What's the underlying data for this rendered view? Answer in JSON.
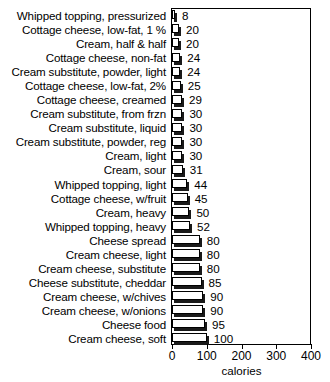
{
  "chart_data": {
    "type": "bar",
    "orientation": "horizontal",
    "title": "",
    "xlabel": "calories",
    "ylabel": "",
    "xlim": [
      0,
      400
    ],
    "xticks": [
      0,
      100,
      200,
      300,
      400
    ],
    "xtick_labels": [
      "0",
      "100",
      "200",
      "300",
      "400"
    ],
    "grid": false,
    "legend": false,
    "categories": [
      "Whipped topping, pressurized",
      "Cottage cheese, low-fat, 1 %",
      "Cream, half & half",
      "Cottage cheese, non-fat",
      "Cream substitute, powder, light",
      "Cottage cheese, low-fat, 2%",
      "Cottage cheese, creamed",
      "Cream substitute, from frzn",
      "Cream substitute, liquid",
      "Cream substitute, powder, reg",
      "Cream, light",
      "Cream, sour",
      "Whipped topping, light",
      "Cottage cheese, w/fruit",
      "Cream, heavy",
      "Whipped topping, heavy",
      "Cheese spread",
      "Cream cheese, light",
      "Cream cheese, substitute",
      "Cheese substitute, cheddar",
      "Cream cheese, w/chives",
      "Cream cheese, w/onions",
      "Cheese food",
      "Cream cheese, soft"
    ],
    "values": [
      8,
      20,
      20,
      24,
      24,
      25,
      29,
      30,
      30,
      30,
      30,
      31,
      44,
      45,
      50,
      52,
      80,
      80,
      80,
      85,
      90,
      90,
      95,
      100
    ],
    "value_labels": [
      "8",
      "20",
      "20",
      "24",
      "24",
      "25",
      "29",
      "30",
      "30",
      "30",
      "30",
      "31",
      "44",
      "45",
      "50",
      "52",
      "80",
      "80",
      "80",
      "85",
      "90",
      "90",
      "95",
      "100"
    ],
    "colors": {
      "bar_face": "#ffffff",
      "bar_outline": "#000000",
      "bar_shadow": "#1a1a1a",
      "axis": "#000000",
      "text": "#000000",
      "background": "#ffffff"
    }
  }
}
